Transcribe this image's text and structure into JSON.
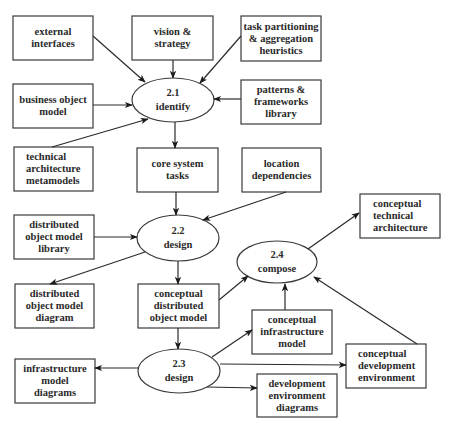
{
  "diagram": {
    "processes": [
      {
        "id": "p21",
        "number": "2.1",
        "verb": "identify"
      },
      {
        "id": "p22",
        "number": "2.2",
        "verb": "design"
      },
      {
        "id": "p23",
        "number": "2.3",
        "verb": "design"
      },
      {
        "id": "p24",
        "number": "2.4",
        "verb": "compose"
      }
    ],
    "artifacts": {
      "external_interfaces": "external\ninterfaces",
      "vision_strategy": "vision &\nstrategy",
      "task_partitioning": "task  partitioning\n& aggregation\nheuristics",
      "business_object_model": "business object\nmodel",
      "patterns_frameworks": "patterns &\nframeworks\nlibrary",
      "technical_architecture_metamodels": "technical\narchitecture\nmetamodels",
      "core_system_tasks": "core system\ntasks",
      "location_dependencies": "location\ndependencies",
      "distributed_object_model_library": "distributed\nobject model\nlibrary",
      "conceptual_technical_architecture": "conceptual\ntechnical\narchitecture",
      "distributed_object_model_diagram": "distributed\nobject model\ndiagram",
      "conceptual_distributed_object_model": "conceptual\ndistributed\nobject model",
      "conceptual_infrastructure_model": "conceptual\ninfrastructure\nmodel",
      "infrastructure_model_diagrams": "infrastructure\nmodel\ndiagrams",
      "conceptual_development_environment": "conceptual\ndevelopment\nenvironment",
      "development_environment_diagrams": "development\nenvironment\ndiagrams"
    },
    "edges": [
      {
        "from": "external interfaces",
        "to": "2.1 identify"
      },
      {
        "from": "vision & strategy",
        "to": "2.1 identify"
      },
      {
        "from": "task partitioning & aggregation heuristics",
        "to": "2.1 identify"
      },
      {
        "from": "business object model",
        "to": "2.1 identify"
      },
      {
        "from": "patterns & frameworks library",
        "to": "2.1 identify"
      },
      {
        "from": "technical architecture metamodels",
        "to": "2.1 identify"
      },
      {
        "from": "2.1 identify",
        "to": "core system tasks"
      },
      {
        "from": "core system tasks",
        "to": "2.2 design"
      },
      {
        "from": "location dependencies",
        "to": "2.2 design"
      },
      {
        "from": "distributed object model library",
        "to": "2.2 design"
      },
      {
        "from": "2.2 design",
        "to": "distributed object model diagram"
      },
      {
        "from": "2.2 design",
        "to": "conceptual distributed object model"
      },
      {
        "from": "conceptual distributed object model",
        "to": "2.4 compose"
      },
      {
        "from": "conceptual distributed object model",
        "to": "2.3 design"
      },
      {
        "from": "2.3 design",
        "to": "infrastructure model diagrams"
      },
      {
        "from": "2.3 design",
        "to": "conceptual infrastructure model"
      },
      {
        "from": "2.3 design",
        "to": "conceptual development environment"
      },
      {
        "from": "2.3 design",
        "to": "development environment diagrams"
      },
      {
        "from": "conceptual infrastructure model",
        "to": "2.4 compose"
      },
      {
        "from": "conceptual development environment",
        "to": "2.4 compose"
      },
      {
        "from": "2.4 compose",
        "to": "conceptual technical architecture"
      }
    ]
  }
}
